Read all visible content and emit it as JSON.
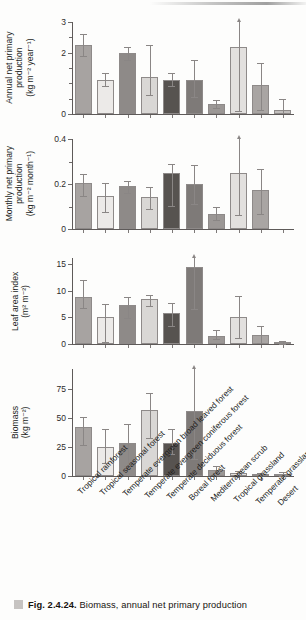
{
  "caption": {
    "figure_number": "Fig. 2.4.24.",
    "text": "Biomass, annual net primary production"
  },
  "categories": [
    "Tropical rainforest",
    "Tropical seasonal forest",
    "Temperate evergreen broad leaved forest",
    "Temperate evergreen coniferous forest",
    "Temperate deciduous forest",
    "Boreal forest",
    "Mediterranean scrub",
    "Tropical grassland",
    "Temperate grassland",
    "Desert"
  ],
  "bar_colors": [
    "#a7a3a1",
    "#eceae8",
    "#8e8a88",
    "#d9d7d5",
    "#575350",
    "#7e7a78",
    "#9b9795",
    "#e2e0de",
    "#a9a5a3",
    "#c2bfbd"
  ],
  "chart_data": [
    {
      "type": "bar",
      "panel": 1,
      "title": "",
      "ylabel": "Annual net primary production (kg m⁻² year⁻¹)",
      "ylabel_lines": [
        "Annual net primary",
        "production",
        "(kg m⁻² year⁻¹)"
      ],
      "xlabel": "",
      "ylim": [
        0,
        3
      ],
      "yticks": [
        0,
        2,
        3
      ],
      "ytick_labels": [
        "0",
        "2",
        "3"
      ],
      "yminor": [
        0.5,
        1,
        1.5,
        2.5
      ],
      "grid": false,
      "categories": [
        "Tropical rainforest",
        "Tropical seasonal forest",
        "Temperate evergreen broad leaved forest",
        "Temperate evergreen coniferous forest",
        "Temperate deciduous forest",
        "Boreal forest",
        "Mediterranean scrub",
        "Tropical grassland",
        "Temperate grassland",
        "Desert"
      ],
      "values": [
        2.25,
        1.1,
        1.98,
        1.22,
        1.1,
        1.1,
        0.32,
        2.2,
        0.95,
        0.12
      ],
      "err_low": [
        1.9,
        0.9,
        1.75,
        0.62,
        0.92,
        0.55,
        0.2,
        0.1,
        0.12,
        0.02
      ],
      "err_high": [
        2.6,
        1.35,
        2.2,
        2.25,
        1.35,
        1.75,
        0.45,
        3.0,
        1.65,
        0.48
      ],
      "err_exceeds_axis": [
        false,
        false,
        false,
        false,
        false,
        false,
        false,
        true,
        false,
        false
      ]
    },
    {
      "type": "bar",
      "panel": 2,
      "title": "",
      "ylabel": "Monthly net primary production (kg m⁻² month⁻¹)",
      "ylabel_lines": [
        "Monthly net primary",
        "production",
        "(kg m⁻² month⁻¹)"
      ],
      "xlabel": "",
      "ylim": [
        0,
        0.4
      ],
      "yticks": [
        0,
        0.2,
        0.4
      ],
      "ytick_labels": [
        "0",
        "0.2",
        "0.4"
      ],
      "yminor": [
        0.1,
        0.3
      ],
      "grid": false,
      "categories": [
        "Tropical rainforest",
        "Tropical seasonal forest",
        "Temperate evergreen broad leaved forest",
        "Temperate evergreen coniferous forest",
        "Temperate deciduous forest",
        "Boreal forest",
        "Mediterranean scrub",
        "Tropical grassland"
      ],
      "values": [
        0.205,
        0.145,
        0.19,
        0.142,
        0.247,
        0.2,
        0.068,
        0.247,
        0.172
      ],
      "err_low": [
        0.148,
        0.077,
        0.158,
        0.09,
        0.103,
        0.113,
        0.04,
        0.063,
        0.067
      ],
      "err_high": [
        0.243,
        0.205,
        0.213,
        0.185,
        0.29,
        0.283,
        0.098,
        0.4,
        0.268
      ],
      "err_exceeds_axis": [
        false,
        false,
        false,
        false,
        false,
        false,
        false,
        true,
        false
      ],
      "note": "Desert bar absent in this panel"
    },
    {
      "type": "bar",
      "panel": 3,
      "title": "",
      "ylabel": "Leaf area index (m² m⁻²)",
      "ylabel_lines": [
        "Leaf area index",
        "(m² m⁻²)"
      ],
      "xlabel": "",
      "ylim": [
        0,
        16.2
      ],
      "yticks": [
        0,
        5,
        10,
        15
      ],
      "ytick_labels": [
        "0",
        "5",
        "10",
        "15"
      ],
      "yminor": [],
      "grid": false,
      "categories": [
        "Tropical rainforest",
        "Tropical seasonal forest",
        "Temperate evergreen broad leaved forest",
        "Temperate evergreen coniferous forest",
        "Temperate deciduous forest",
        "Boreal forest",
        "Mediterranean scrub",
        "Tropical grassland",
        "Temperate grassland",
        "Desert"
      ],
      "values": [
        8.8,
        5.0,
        7.3,
        8.4,
        5.9,
        14.5,
        1.5,
        5.0,
        1.7,
        0.25
      ],
      "err_low": [
        6.8,
        0.3,
        4.9,
        7.2,
        3.4,
        6.6,
        0.85,
        1.2,
        0.2,
        0.05
      ],
      "err_high": [
        12.1,
        7.6,
        8.9,
        9.2,
        7.8,
        16.2,
        2.6,
        9.0,
        3.4,
        0.5
      ],
      "err_exceeds_axis": [
        false,
        false,
        false,
        false,
        false,
        true,
        false,
        false,
        false,
        false
      ]
    },
    {
      "type": "bar",
      "panel": 4,
      "title": "",
      "ylabel": "Biomass (kg m⁻²)",
      "ylabel_lines": [
        "Biomass",
        "(kg m⁻²)"
      ],
      "xlabel": "",
      "ylim": [
        0,
        92
      ],
      "yticks": [
        0,
        25,
        50,
        75
      ],
      "ytick_labels": [
        "0",
        "25",
        "50",
        "75"
      ],
      "yminor": [],
      "grid": false,
      "categories": [
        "Tropical rainforest",
        "Tropical seasonal forest",
        "Temperate evergreen broad leaved forest",
        "Temperate evergreen coniferous forest",
        "Temperate deciduous forest",
        "Boreal forest",
        "Mediterranean scrub",
        "Tropical grassland",
        "Temperate grassland",
        "Desert"
      ],
      "values": [
        42,
        25,
        28.5,
        56.5,
        28.5,
        56,
        5,
        2.2,
        1.2,
        1.5
      ],
      "err_low": [
        27,
        11,
        9,
        33,
        19,
        15,
        2.5,
        0.6,
        0.3,
        0.4
      ],
      "err_high": [
        51,
        40,
        45,
        71,
        40,
        92,
        8.5,
        4.5,
        3.0,
        3.6
      ],
      "err_exceeds_axis": [
        false,
        false,
        false,
        false,
        false,
        true,
        false,
        false,
        false,
        false
      ]
    }
  ]
}
